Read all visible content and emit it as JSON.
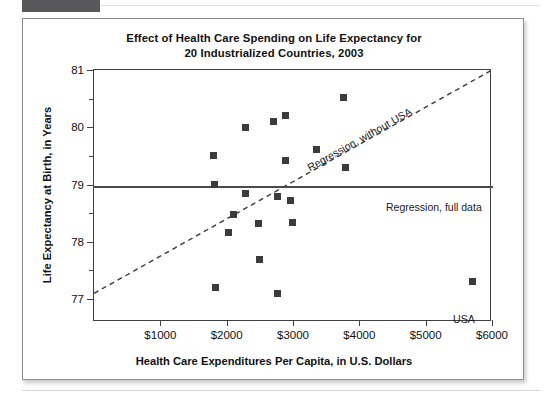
{
  "figure": {
    "title_line1": "Effect of Health Care Spending on Life Expectancy for",
    "title_line2": "20 Industrialized Countries, 2003"
  },
  "annotations": {
    "reg_full_label": "Regression, full data",
    "reg_nousa_label": "Regression, without USA",
    "usa_point_label": "USA"
  },
  "chart_data": {
    "type": "scatter",
    "title": "Effect of Health Care Spending on Life Expectancy for 20 Industrialized Countries, 2003",
    "xlabel": "Health Care Expenditures Per Capita, in U.S. Dollars",
    "ylabel": "Life Expectancy at Birth, in Years",
    "xlim": [
      0,
      6000
    ],
    "ylim": [
      76.6,
      81.0
    ],
    "grid": false,
    "legend_position": "inline-annotations",
    "xticks": [
      1000,
      2000,
      3000,
      4000,
      5000,
      6000
    ],
    "xticklabels": [
      "$1000",
      "$2000",
      "$3000",
      "$4000",
      "$5000",
      "$6000"
    ],
    "yticks": [
      77,
      78,
      79,
      80,
      81
    ],
    "yticklabels": [
      "77",
      "78",
      "79",
      "80",
      "81"
    ],
    "y_minor_ticks": [
      77.5,
      78.5,
      79.5,
      80.5
    ],
    "marker": "filled-square",
    "marker_color": "#3b3b3b",
    "points": [
      {
        "x": 1800,
        "y": 79.5,
        "label": ""
      },
      {
        "x": 1820,
        "y": 79.0,
        "label": ""
      },
      {
        "x": 1830,
        "y": 77.2,
        "label": ""
      },
      {
        "x": 2030,
        "y": 78.17,
        "label": ""
      },
      {
        "x": 2100,
        "y": 78.48,
        "label": ""
      },
      {
        "x": 2280,
        "y": 80.0,
        "label": ""
      },
      {
        "x": 2290,
        "y": 78.85,
        "label": ""
      },
      {
        "x": 2480,
        "y": 78.32,
        "label": ""
      },
      {
        "x": 2500,
        "y": 77.7,
        "label": ""
      },
      {
        "x": 2700,
        "y": 80.1,
        "label": ""
      },
      {
        "x": 2760,
        "y": 78.8,
        "label": ""
      },
      {
        "x": 2770,
        "y": 77.1,
        "label": ""
      },
      {
        "x": 2880,
        "y": 80.2,
        "label": ""
      },
      {
        "x": 2890,
        "y": 79.42,
        "label": ""
      },
      {
        "x": 2960,
        "y": 78.73,
        "label": ""
      },
      {
        "x": 2990,
        "y": 78.33,
        "label": ""
      },
      {
        "x": 3360,
        "y": 79.62,
        "label": ""
      },
      {
        "x": 3760,
        "y": 80.52,
        "label": ""
      },
      {
        "x": 3790,
        "y": 79.3,
        "label": ""
      },
      {
        "x": 5700,
        "y": 77.3,
        "label": "USA"
      }
    ],
    "lines": [
      {
        "name": "Regression, full data",
        "style": "solid",
        "color": "#4a4a4a",
        "x": [
          0,
          6000
        ],
        "y": [
          78.95,
          78.95
        ]
      },
      {
        "name": "Regression, without USA",
        "style": "dashed",
        "color": "#3a3a3a",
        "x": [
          0,
          6000
        ],
        "y": [
          77.1,
          81.0
        ]
      }
    ]
  }
}
